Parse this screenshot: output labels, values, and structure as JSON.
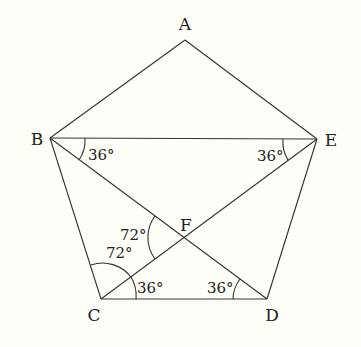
{
  "diagram": {
    "type": "regular pentagon with diagonals",
    "vertices": [
      {
        "id": "A",
        "label": "A",
        "x": 185,
        "y": 40,
        "lx": 185,
        "ly": 30
      },
      {
        "id": "B",
        "label": "B",
        "x": 50,
        "y": 138,
        "lx": 37,
        "ly": 145
      },
      {
        "id": "C",
        "label": "C",
        "x": 101,
        "y": 299,
        "lx": 94,
        "ly": 321
      },
      {
        "id": "D",
        "label": "D",
        "x": 267,
        "y": 299,
        "lx": 272,
        "ly": 321
      },
      {
        "id": "E",
        "label": "E",
        "x": 317,
        "y": 139,
        "lx": 331,
        "ly": 146
      },
      {
        "id": "F",
        "label": "F",
        "x": 184,
        "y": 237,
        "lx": 186,
        "ly": 231
      }
    ],
    "edges": [
      [
        "A",
        "B"
      ],
      [
        "A",
        "E"
      ],
      [
        "B",
        "C"
      ],
      [
        "C",
        "D"
      ],
      [
        "D",
        "E"
      ],
      [
        "B",
        "E"
      ],
      [
        "B",
        "D"
      ],
      [
        "C",
        "E"
      ]
    ],
    "angle_labels": [
      {
        "id": "angle-EBD",
        "text": "36°",
        "x": 88,
        "y": 160
      },
      {
        "id": "angle-BEC",
        "text": "36°",
        "x": 257,
        "y": 161
      },
      {
        "id": "angle-CFD-upper",
        "text": "72°",
        "x": 120,
        "y": 240
      },
      {
        "id": "angle-BCF",
        "text": "72°",
        "x": 106,
        "y": 258
      },
      {
        "id": "angle-FCD",
        "text": "36°",
        "x": 137,
        "y": 293
      },
      {
        "id": "angle-FDC",
        "text": "36°",
        "x": 207,
        "y": 293
      }
    ]
  }
}
